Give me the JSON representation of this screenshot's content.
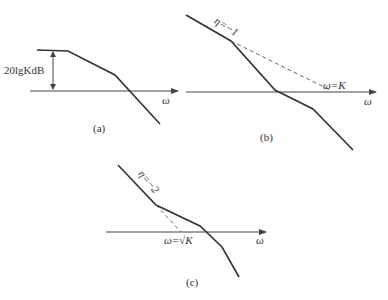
{
  "diagram": {
    "panels": [
      {
        "id": "a",
        "caption": "(a)",
        "axis_label": "ω",
        "gain_label": "20lgKdB"
      },
      {
        "id": "b",
        "caption": "(b)",
        "axis_label": "ω",
        "slope_label": "η=−1",
        "crossover_label": "ω=K"
      },
      {
        "id": "c",
        "caption": "(c)",
        "axis_label": "ω",
        "slope_label": "η=−2",
        "crossover_label": "ω=√K"
      }
    ],
    "colors": {
      "line": "#333333",
      "axis": "#444444",
      "dashed": "#666666"
    }
  }
}
